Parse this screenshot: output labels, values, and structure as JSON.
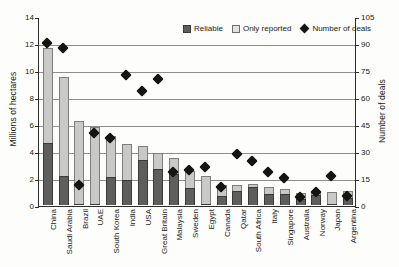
{
  "chart_data": {
    "type": "bar",
    "title": "",
    "subtitle": "",
    "xlabel": "",
    "ylabel": "Millions of hectares",
    "y2label": "Number of deals",
    "ylim": [
      0,
      14
    ],
    "y2lim": [
      0,
      105
    ],
    "yticks": [
      "0",
      "2",
      "4",
      "6",
      "8",
      "10",
      "12",
      "14"
    ],
    "y2ticks": [
      "0",
      "15",
      "30",
      "45",
      "60",
      "75",
      "90",
      "105"
    ],
    "grid": true,
    "legend_position": "top-right",
    "legend": [
      {
        "key": "reliable",
        "label": "Reliable",
        "marker": "square",
        "color": "#5e5e5c"
      },
      {
        "key": "only_reported",
        "label": "Only reported",
        "marker": "square",
        "color": "#e2e2e0"
      },
      {
        "key": "number_of_deals",
        "label": "Number of deals",
        "marker": "diamond",
        "color": "#15150f"
      }
    ],
    "categories": [
      "China",
      "Saudi Arabia",
      "Brazil",
      "UAE",
      "South Korea",
      "India",
      "USA",
      "Great Britain",
      "Malaysia",
      "Sweden",
      "Egypt",
      "Canada",
      "Qatar",
      "South Africa",
      "Italy",
      "Singapore",
      "Australia",
      "Norway",
      "Japan",
      "Argentina"
    ],
    "series": [
      {
        "name": "Reliable",
        "axis": "left",
        "units": "Millions of hectares",
        "values": [
          4.6,
          2.15,
          0.1,
          0.05,
          2.1,
          1.85,
          3.3,
          2.65,
          2.3,
          1.25,
          0.05,
          0.7,
          1.05,
          1.35,
          0.8,
          0.85,
          0.45,
          0.75,
          0.1,
          0.5
        ]
      },
      {
        "name": "Only reported",
        "axis": "left",
        "units": "Millions of hectares",
        "values": [
          7.0,
          7.35,
          6.1,
          5.7,
          3.0,
          2.7,
          1.05,
          1.2,
          1.2,
          1.3,
          2.1,
          0.75,
          0.45,
          0.2,
          0.5,
          0.35,
          0.45,
          0.25,
          0.85,
          0.55
        ]
      },
      {
        "name": "Total (stack)",
        "axis": "left",
        "units": "Millions of hectares",
        "values": [
          11.6,
          9.5,
          6.2,
          5.75,
          5.1,
          4.55,
          4.35,
          3.85,
          3.5,
          2.55,
          2.15,
          1.45,
          1.5,
          1.55,
          1.3,
          1.2,
          0.9,
          1.0,
          0.95,
          1.05
        ]
      },
      {
        "name": "Number of deals",
        "axis": "right",
        "units": "deals",
        "values": [
          93,
          90,
          14,
          43,
          40,
          75,
          66,
          73,
          21,
          22,
          24,
          13,
          31,
          27,
          21,
          18,
          7,
          10,
          19,
          8
        ]
      }
    ]
  }
}
